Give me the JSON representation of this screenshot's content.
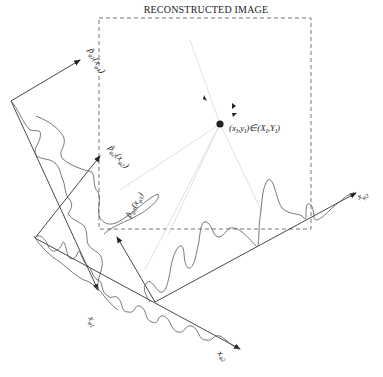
{
  "title": "RECONSTRUCTED IMAGE",
  "point_label": "(x_I, y_I) ∈ (X_I, Y_I)",
  "point_label_parts": {
    "open": "(x",
    "sub1": "I",
    "mid": ",y",
    "sub2": "I",
    "rel": ")∈(X",
    "sub3": "I",
    "mid2": ",Y",
    "sub4": "I",
    "close": ")"
  },
  "projections": [
    {
      "name": "phi1",
      "profile_label": "p̃",
      "profile_sub": "φ1",
      "arg": "(x",
      "arg_sub": "φ1",
      "arg_close": ")",
      "axis_label": "x",
      "axis_sub": "φ1"
    },
    {
      "name": "phi2",
      "profile_label": "p̃",
      "profile_sub": "φ2",
      "arg": "(x",
      "arg_sub": "φ2",
      "arg_close": ")",
      "axis_label": "x",
      "axis_sub": "φ2"
    },
    {
      "name": "phi3",
      "profile_label": "p̃",
      "profile_sub": "φ3",
      "arg": "(x",
      "arg_sub": "φ3",
      "arg_close": ")",
      "axis_label": "x",
      "axis_sub": "φ3"
    }
  ],
  "colors": {
    "line": "#333333",
    "curve": "#555555",
    "ray": "#d8d8d8",
    "background": "#ffffff"
  }
}
